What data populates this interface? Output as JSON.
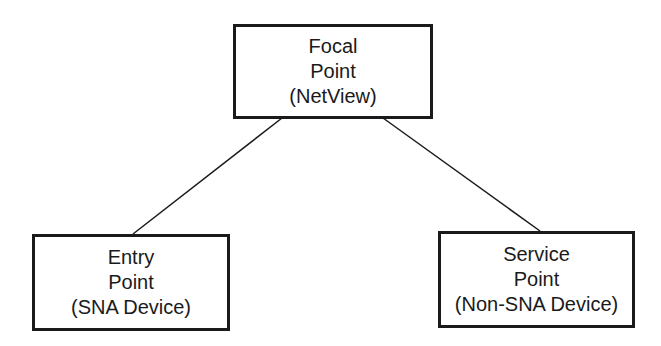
{
  "diagram": {
    "nodes": [
      {
        "id": "focal",
        "lines": [
          "Focal",
          "Point",
          "(NetView)"
        ]
      },
      {
        "id": "entry",
        "lines": [
          "Entry",
          "Point",
          "(SNA Device)"
        ]
      },
      {
        "id": "service",
        "lines": [
          "Service",
          "Point",
          "(Non-SNA Device)"
        ]
      }
    ],
    "edges": [
      {
        "from": "focal",
        "to": "entry"
      },
      {
        "from": "focal",
        "to": "service"
      }
    ],
    "colors": {
      "stroke": "#1a1a1a",
      "background": "#ffffff"
    }
  }
}
